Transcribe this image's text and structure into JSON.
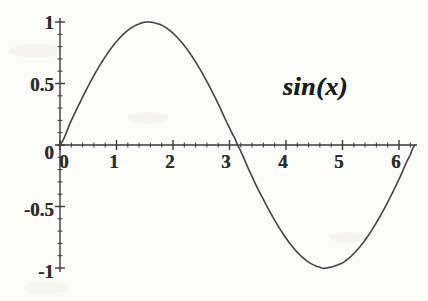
{
  "chart_data": {
    "type": "line",
    "title": "",
    "subtitle": "",
    "xlabel": "",
    "ylabel": "",
    "annotation": "sin(x)",
    "function": "sin(x)",
    "grid": false,
    "legend_position": "none",
    "xlim": [
      0,
      6.283185
    ],
    "ylim": [
      -1,
      1
    ],
    "x_ticks": [
      0,
      1,
      2,
      3,
      4,
      5,
      6
    ],
    "x_tick_labels": [
      "0",
      "1",
      "2",
      "3",
      "4",
      "5",
      "6"
    ],
    "x_minor_tick_step": 0.2,
    "y_ticks": [
      -1,
      -0.5,
      0,
      0.5,
      1
    ],
    "y_tick_labels": [
      "-1",
      "-0.5",
      "0",
      "0.5",
      "1"
    ],
    "y_minor_tick_step": 0.1,
    "series": [
      {
        "name": "sin(x)",
        "color": "#444444",
        "x": [
          0,
          0.2,
          0.4,
          0.6,
          0.8,
          1.0,
          1.2,
          1.4,
          1.5708,
          1.8,
          2.0,
          2.2,
          2.4,
          2.6,
          2.8,
          3.0,
          3.1416,
          3.4,
          3.6,
          3.8,
          4.0,
          4.2,
          4.4,
          4.6,
          4.7124,
          5.0,
          5.2,
          5.4,
          5.6,
          5.8,
          6.0,
          6.2,
          6.2832
        ],
        "y": [
          0,
          0.199,
          0.389,
          0.565,
          0.717,
          0.841,
          0.932,
          0.985,
          1.0,
          0.974,
          0.909,
          0.808,
          0.675,
          0.516,
          0.335,
          0.141,
          0,
          -0.256,
          -0.443,
          -0.612,
          -0.757,
          -0.872,
          -0.952,
          -0.994,
          -1.0,
          -0.959,
          -0.883,
          -0.773,
          -0.631,
          -0.465,
          -0.279,
          -0.083,
          0
        ]
      }
    ],
    "key_points": {
      "maximum": {
        "x": 1.5708,
        "y": 1,
        "label": "peak at pi/2"
      },
      "minimum": {
        "x": 4.7124,
        "y": -1,
        "label": "trough at 3pi/2"
      },
      "zero_crossings": [
        0,
        3.1416,
        6.2832
      ]
    },
    "style": {
      "background": "#fbfbfa",
      "axis_color": "#3a3a3a",
      "curve_color": "#444444",
      "text_color": "#2e2e2e",
      "curve_width": 1.6,
      "axis_width": 1.4
    }
  },
  "labels": {
    "y": {
      "one": "1",
      "half": "0.5",
      "zero": "0",
      "neg_half": "-0.5",
      "neg_one": "-1"
    },
    "x": {
      "zero": "0",
      "one": "1",
      "two": "2",
      "three": "3",
      "four": "4",
      "five": "5",
      "six": "6"
    },
    "curve": "sin(x)"
  }
}
